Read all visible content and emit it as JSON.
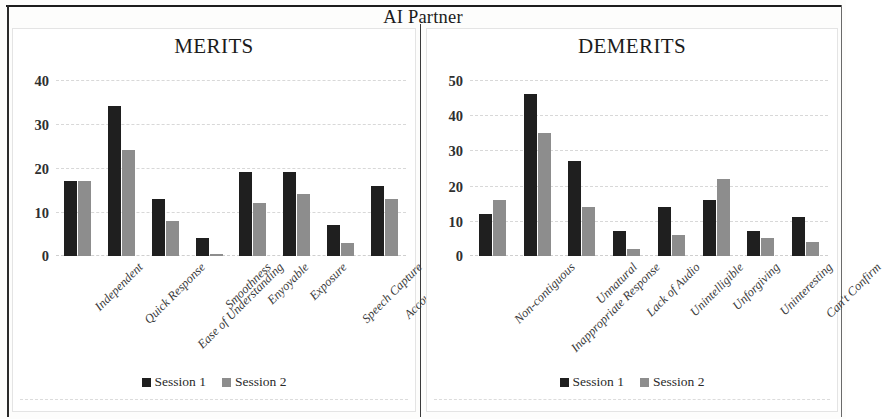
{
  "header": {
    "title": "AI Partner"
  },
  "legend": {
    "series": [
      {
        "label": "Session 1",
        "color": "#1f1f1f"
      },
      {
        "label": "Session 2",
        "color": "#8d8d8d"
      }
    ]
  },
  "chart_data": [
    {
      "type": "bar",
      "title": "MERITS",
      "xlabel": "",
      "ylabel": "",
      "ylim": [
        0,
        40
      ],
      "yticks": [
        0,
        10,
        20,
        30,
        40
      ],
      "grid": true,
      "legend_position": "bottom",
      "categories": [
        "Independent",
        "Quick Response",
        "Ease of Understanding",
        "Smoothness",
        "Enyoyable",
        "Exposure",
        "Speech Capture",
        "Accountability"
      ],
      "series": [
        {
          "name": "Session 1",
          "color": "#1f1f1f",
          "values": [
            17,
            34,
            13,
            4,
            19,
            19,
            7,
            16
          ]
        },
        {
          "name": "Session 2",
          "color": "#8d8d8d",
          "values": [
            17,
            24,
            8,
            0.5,
            12,
            14,
            3,
            13
          ]
        }
      ]
    },
    {
      "type": "bar",
      "title": "DEMERITS",
      "xlabel": "",
      "ylabel": "",
      "ylim": [
        0,
        50
      ],
      "yticks": [
        0,
        10,
        20,
        30,
        40,
        50
      ],
      "grid": true,
      "legend_position": "bottom",
      "categories": [
        "Non-contiguous",
        "Inappropriate Response",
        "Unnatural",
        "Lack of Audio",
        "Unintelligible",
        "Unforgiving",
        "Uninteresting",
        "Can't Confirm"
      ],
      "series": [
        {
          "name": "Session 1",
          "color": "#1f1f1f",
          "values": [
            12,
            46,
            27,
            7,
            14,
            16,
            7,
            11
          ]
        },
        {
          "name": "Session 2",
          "color": "#8d8d8d",
          "values": [
            16,
            35,
            14,
            2,
            6,
            22,
            5,
            4
          ]
        }
      ]
    }
  ]
}
